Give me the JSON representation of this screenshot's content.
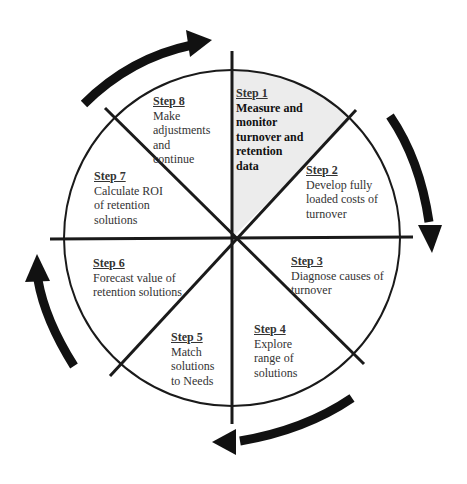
{
  "diagram": {
    "title": "",
    "type": "cycle",
    "highlight_color": "#ececec",
    "line_color": "#1a1a1a",
    "arrow_color": "#111111",
    "arrows": [
      "clockwise-top",
      "clockwise-right",
      "clockwise-bottom",
      "clockwise-left"
    ],
    "steps": [
      {
        "step": "Step  1",
        "desc": [
          "Measure and",
          "monitor",
          "turnover and",
          "retention",
          "data"
        ],
        "highlighted": true
      },
      {
        "step": "Step 2",
        "desc": [
          "Develop fully",
          "loaded costs of",
          "turnover"
        ]
      },
      {
        "step": "Step 3",
        "desc": [
          "Diagnose causes of",
          "turnover"
        ]
      },
      {
        "step": "Step 4",
        "desc": [
          "Explore",
          "range of",
          "solutions"
        ]
      },
      {
        "step": "Step 5",
        "desc": [
          "Match",
          "solutions",
          "to Needs"
        ]
      },
      {
        "step": "Step 6",
        "desc": [
          "Forecast value of",
          "retention solutions"
        ]
      },
      {
        "step": "Step 7",
        "desc": [
          "Calculate ROI",
          "of retention",
          "solutions"
        ]
      },
      {
        "step": "Step 8",
        "desc": [
          "Make",
          "adjustments",
          "and",
          "continue"
        ]
      }
    ]
  }
}
